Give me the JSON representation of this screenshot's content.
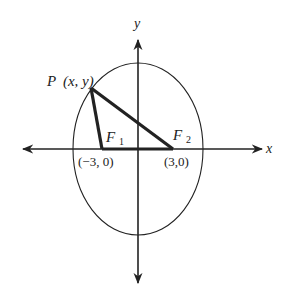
{
  "figure": {
    "axes": {
      "x_label": "x",
      "y_label": "y"
    },
    "point_p": {
      "name": "P",
      "coords": "(x, y)"
    },
    "focus_1": {
      "name": "F",
      "subscript": "1",
      "coords": "(−3, 0)"
    },
    "focus_2": {
      "name": "F",
      "subscript": "2",
      "coords": "(3,0)"
    },
    "colors": {
      "line": "#222222",
      "background": "#ffffff"
    }
  }
}
